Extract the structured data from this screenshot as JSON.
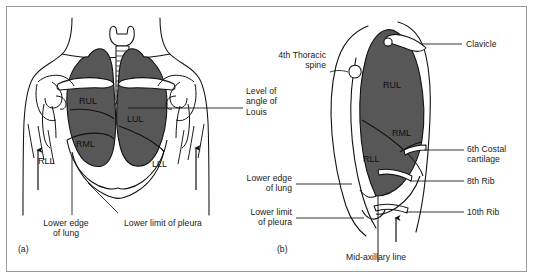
{
  "figure": {
    "frame_color": "#9a9a9a",
    "lung_fill": "#575757",
    "line_color": "#111111",
    "background": "#ffffff"
  },
  "panels": [
    {
      "tag": "(a)",
      "name": "anterior-view",
      "description": "Anterior chest wall view"
    },
    {
      "tag": "(b)",
      "name": "lateral-view",
      "description": "Right lateral chest wall view"
    }
  ],
  "lobes": {
    "anterior": [
      {
        "abbr": "RUL",
        "name": "right-upper-lobe"
      },
      {
        "abbr": "LUL",
        "name": "left-upper-lobe"
      },
      {
        "abbr": "RML",
        "name": "right-middle-lobe"
      },
      {
        "abbr": "RLL",
        "name": "right-lower-lobe"
      },
      {
        "abbr": "LLL",
        "name": "left-lower-lobe"
      }
    ],
    "lateral": [
      {
        "abbr": "RUL",
        "name": "right-upper-lobe"
      },
      {
        "abbr": "RML",
        "name": "right-middle-lobe"
      },
      {
        "abbr": "RLL",
        "name": "right-lower-lobe"
      }
    ]
  },
  "annotations_left": {
    "angle_of_louis": "Level of\nangle of\nLouis",
    "lower_edge_of_lung": "Lower edge\nof lung",
    "lower_limit_of_pleura": "Lower limit of pleura"
  },
  "annotations_right": {
    "thoracic_spine": "4th Thoracic\nspine",
    "clavicle": "Clavicle",
    "costal_cartilage": "6th Costal\ncartilage",
    "rib8": "8th Rib",
    "rib10": "10th Rib",
    "lower_edge_of_lung": "Lower edge\nof lung",
    "lower_limit_of_pleura": "Lower limit\nof pleura",
    "mid_axillary_line": "Mid-axillary line"
  }
}
